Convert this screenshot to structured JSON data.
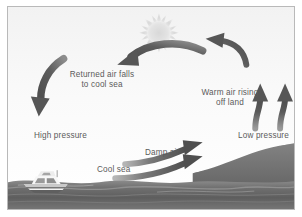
{
  "figure": {
    "background_color": "#fbfbfb",
    "border_color": "#b9b9b9",
    "arrow_color": "#595959",
    "text_color": "#5b5b5b",
    "land_color": "#6f6f6f",
    "sea_color": "#6a6a6a",
    "sun_color": "#e2e2e2"
  },
  "labels": {
    "returned_air": {
      "line1": "Returned air falls",
      "line2": "to cool sea"
    },
    "warm_air": {
      "line1": "Warm air rising",
      "line2": "off land"
    },
    "high_pressure": "High pressure",
    "low_pressure": "Low pressure",
    "damp_air": "Damp air",
    "cool_sea": "Cool sea"
  },
  "elements": {
    "sun": "sun-icon",
    "boat": "boat-icon",
    "land": "land-hill",
    "sea": "sea-water",
    "arrow_descending_left": "arrow-descending-left",
    "arrow_top_left": "arrow-top-leftward",
    "arrow_top_right": "arrow-top-upleft",
    "arrow_rising_inner": "arrow-rising-inner",
    "arrow_rising_outer": "arrow-rising-outer",
    "arrow_damp_upper": "arrow-damp-upper",
    "arrow_damp_lower": "arrow-damp-lower"
  }
}
